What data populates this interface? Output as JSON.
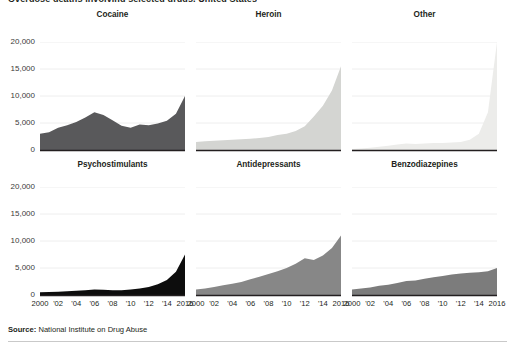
{
  "figure": {
    "title": "Overdose deaths involving selected drugs, United States",
    "source_label": "Source:",
    "source_text": "National Institute on Drug Abuse"
  },
  "axis": {
    "ytick_labels": [
      "20,000",
      "15,000",
      "10,000",
      "5,000",
      "0"
    ],
    "ytick_values": [
      20000,
      15000,
      10000,
      5000,
      0
    ],
    "xtick_labels": [
      "2000",
      "'02",
      "'04",
      "'06",
      "'08",
      "'10",
      "'12",
      "'14",
      "2016"
    ],
    "xtick_values": [
      2000,
      2002,
      2004,
      2006,
      2008,
      2010,
      2012,
      2014,
      2016
    ]
  },
  "colors": {
    "cocaine": "#59595b",
    "heroin": "#d4d5d2",
    "other": "#ececea",
    "psychostimulants": "#0d0d0d",
    "antidepressants": "#878787",
    "benzodiazepines": "#7c7c7c",
    "axis_line": "#231f20",
    "gridline": "#eeeeee",
    "text": "#231f20"
  },
  "panels": [
    {
      "key": "cocaine",
      "title": "Cocaine",
      "row": 0,
      "col": 0
    },
    {
      "key": "heroin",
      "title": "Heroin",
      "row": 0,
      "col": 1
    },
    {
      "key": "other",
      "title": "Other",
      "row": 0,
      "col": 2
    },
    {
      "key": "psychostimulants",
      "title": "Psychostimulants",
      "row": 1,
      "col": 0
    },
    {
      "key": "antidepressants",
      "title": "Antidepressants",
      "row": 1,
      "col": 1
    },
    {
      "key": "benzodiazepines",
      "title": "Benzodiazepines",
      "row": 1,
      "col": 2
    }
  ],
  "chart_data": {
    "type": "area",
    "title": "Overdose deaths involving selected drugs, United States",
    "xlabel": "",
    "ylabel": "",
    "xlim": [
      2000,
      2016
    ],
    "ylim": [
      0,
      20000
    ],
    "grid": true,
    "legend": "none",
    "small_multiples": true,
    "x": [
      2000,
      2001,
      2002,
      2003,
      2004,
      2005,
      2006,
      2007,
      2008,
      2009,
      2010,
      2011,
      2012,
      2013,
      2014,
      2015,
      2016
    ],
    "series": [
      {
        "name": "Cocaine",
        "color": "#59595b",
        "values": [
          3000,
          3300,
          4100,
          4600,
          5200,
          6000,
          7000,
          6500,
          5500,
          4500,
          4100,
          4700,
          4600,
          4900,
          5400,
          6700,
          10000
        ]
      },
      {
        "name": "Heroin",
        "color": "#d4d5d2",
        "values": [
          1500,
          1600,
          1700,
          1800,
          1900,
          2000,
          2100,
          2200,
          2400,
          2800,
          3000,
          3500,
          4400,
          6200,
          8200,
          11000,
          15500
        ]
      },
      {
        "name": "Other",
        "color": "#ececea",
        "values": [
          200,
          300,
          400,
          600,
          800,
          1000,
          1200,
          1100,
          1200,
          1300,
          1300,
          1400,
          1500,
          1900,
          3000,
          7000,
          20000
        ]
      },
      {
        "name": "Psychostimulants",
        "color": "#0d0d0d",
        "values": [
          500,
          550,
          600,
          700,
          800,
          900,
          1000,
          950,
          900,
          900,
          1000,
          1200,
          1500,
          2000,
          2800,
          4300,
          7500
        ]
      },
      {
        "name": "Antidepressants",
        "color": "#878787",
        "values": [
          1000,
          1200,
          1500,
          1800,
          2100,
          2400,
          2900,
          3400,
          3900,
          4400,
          5000,
          5800,
          6800,
          6500,
          7300,
          8700,
          11000
        ]
      },
      {
        "name": "Benzodiazepines",
        "color": "#7c7c7c",
        "values": [
          1000,
          1200,
          1400,
          1700,
          1900,
          2200,
          2600,
          2700,
          3000,
          3300,
          3500,
          3800,
          4000,
          4100,
          4200,
          4400,
          5000
        ]
      }
    ]
  }
}
